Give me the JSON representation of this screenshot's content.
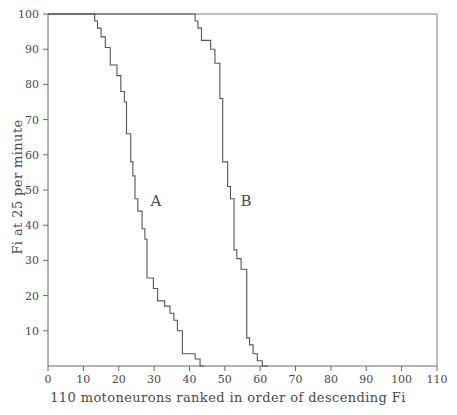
{
  "chart_data": {
    "type": "line",
    "title": "",
    "subtitle": "",
    "xlabel": "110 motoneurons  ranked in order of descending Fi",
    "ylabel": "Fi at 25 per minute",
    "xlim": [
      0,
      110
    ],
    "ylim": [
      0,
      100
    ],
    "xticks": [
      0,
      10,
      20,
      30,
      40,
      50,
      60,
      70,
      80,
      90,
      100,
      110
    ],
    "xtick_labels": [
      "0",
      "10",
      "20",
      "30",
      "40",
      "50",
      "60",
      "70",
      "80",
      "90",
      "100",
      "110"
    ],
    "yticks": [
      10,
      20,
      30,
      40,
      50,
      60,
      70,
      80,
      90,
      100
    ],
    "ytick_labels": [
      "10",
      "20",
      "30",
      "40",
      "50",
      "60",
      "70",
      "80",
      "90",
      "100"
    ],
    "grid": false,
    "legend_position": "inline-annotation",
    "annotations": [
      {
        "text": "A",
        "x": 30.5,
        "y": 45.5
      },
      {
        "text": "B",
        "x": 56.0,
        "y": 45.5
      }
    ],
    "series": [
      {
        "name": "A",
        "step_style": "post",
        "points": [
          [
            0,
            100
          ],
          [
            13.2,
            100
          ],
          [
            13.2,
            98
          ],
          [
            14.0,
            98
          ],
          [
            14.0,
            96
          ],
          [
            15.0,
            96
          ],
          [
            15.0,
            93.5
          ],
          [
            16.2,
            93.5
          ],
          [
            16.2,
            90.5
          ],
          [
            17.6,
            90.5
          ],
          [
            17.6,
            85.5
          ],
          [
            19.5,
            85.5
          ],
          [
            19.5,
            82.5
          ],
          [
            20.6,
            82.5
          ],
          [
            20.6,
            78
          ],
          [
            21.6,
            78
          ],
          [
            21.6,
            75
          ],
          [
            22.2,
            75
          ],
          [
            22.2,
            66
          ],
          [
            23.4,
            66
          ],
          [
            23.4,
            58
          ],
          [
            24.0,
            58
          ],
          [
            24.0,
            54
          ],
          [
            24.6,
            54
          ],
          [
            24.6,
            47.5
          ],
          [
            25.4,
            47.5
          ],
          [
            25.4,
            44
          ],
          [
            26.6,
            44
          ],
          [
            26.6,
            39
          ],
          [
            27.4,
            39
          ],
          [
            27.4,
            36
          ],
          [
            28.0,
            36
          ],
          [
            28.0,
            25
          ],
          [
            29.8,
            25
          ],
          [
            29.8,
            22
          ],
          [
            31.0,
            22
          ],
          [
            31.0,
            18.5
          ],
          [
            33.0,
            18.5
          ],
          [
            33.0,
            17
          ],
          [
            34.5,
            17
          ],
          [
            34.5,
            15
          ],
          [
            35.6,
            15
          ],
          [
            35.6,
            13
          ],
          [
            36.6,
            13
          ],
          [
            36.6,
            10
          ],
          [
            38.0,
            10
          ],
          [
            38.0,
            3.5
          ],
          [
            41.6,
            3.5
          ],
          [
            41.6,
            2
          ],
          [
            43.0,
            2
          ],
          [
            43.0,
            0
          ],
          [
            44.2,
            0
          ]
        ]
      },
      {
        "name": "B",
        "step_style": "post",
        "points": [
          [
            0,
            100
          ],
          [
            41.6,
            100
          ],
          [
            41.6,
            98
          ],
          [
            42.4,
            98
          ],
          [
            42.4,
            96
          ],
          [
            43.4,
            96
          ],
          [
            43.4,
            92.5
          ],
          [
            46.0,
            92.5
          ],
          [
            46.0,
            90
          ],
          [
            47.2,
            90
          ],
          [
            47.2,
            86
          ],
          [
            48.6,
            86
          ],
          [
            48.6,
            76
          ],
          [
            49.4,
            76
          ],
          [
            49.4,
            58
          ],
          [
            50.8,
            58
          ],
          [
            50.8,
            51
          ],
          [
            51.6,
            51
          ],
          [
            51.6,
            47.5
          ],
          [
            52.6,
            47.5
          ],
          [
            52.6,
            33
          ],
          [
            53.4,
            33
          ],
          [
            53.4,
            30.5
          ],
          [
            54.6,
            30.5
          ],
          [
            54.6,
            27.5
          ],
          [
            56.2,
            27.5
          ],
          [
            56.2,
            8
          ],
          [
            57.0,
            8
          ],
          [
            57.0,
            6
          ],
          [
            58.0,
            6
          ],
          [
            58.0,
            3.5
          ],
          [
            59.2,
            3.5
          ],
          [
            59.2,
            1.5
          ],
          [
            60.6,
            1.5
          ],
          [
            60.6,
            0
          ],
          [
            62.2,
            0
          ]
        ]
      }
    ]
  },
  "colors": {
    "background": "#ffffff",
    "axis": "#6b6b6b",
    "curve": "#555555",
    "text": "#4a4a4a"
  },
  "axes": {
    "x_title": "110 motoneurons  ranked in order of descending Fi",
    "y_title": "Fi at 25 per minute"
  },
  "labels": {
    "curve_a": "A",
    "curve_b": "B"
  }
}
